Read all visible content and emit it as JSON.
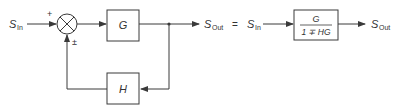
{
  "diagram": {
    "left": {
      "input_label": {
        "main": "S",
        "sub": "In"
      },
      "sum_signs": {
        "top": "+",
        "bottom": "±"
      },
      "forward_block": "G",
      "feedback_block": "H",
      "output_label": {
        "main": "S",
        "sub": "Out"
      }
    },
    "equals": "=",
    "right": {
      "input_label": {
        "main": "S",
        "sub": "In"
      },
      "block_numerator": "G",
      "block_denominator": "1 ∓ HG",
      "output_label": {
        "main": "S",
        "sub": "Out"
      }
    },
    "colors": {
      "stroke": "#3a3a3a",
      "text": "#333333",
      "background": "#ffffff"
    }
  }
}
